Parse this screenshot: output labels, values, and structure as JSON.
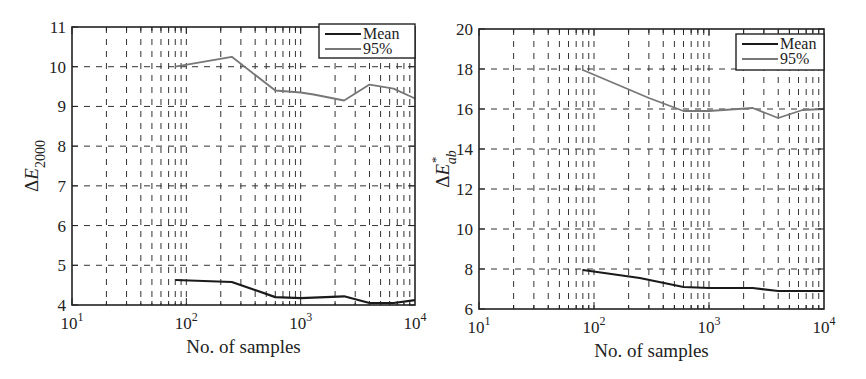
{
  "chart_data": [
    {
      "type": "line",
      "title": "",
      "xlabel": "No. of samples",
      "ylabel": "ΔE2000",
      "ylabel_main": "ΔE",
      "ylabel_sub": "2000",
      "ylabel_sup": "",
      "xscale": "log",
      "xlim": [
        10,
        10000
      ],
      "ylim": [
        4,
        11
      ],
      "yticks": [
        4,
        5,
        6,
        7,
        8,
        9,
        10,
        11
      ],
      "xticks": [
        {
          "base": "10",
          "exp": "1"
        },
        {
          "base": "10",
          "exp": "2"
        },
        {
          "base": "10",
          "exp": "3"
        },
        {
          "base": "10",
          "exp": "4"
        }
      ],
      "grid": true,
      "legend_position": "upper right",
      "series": [
        {
          "name": "Mean",
          "color": "#1a1a1a",
          "x": [
            80,
            250,
            600,
            1000,
            2400,
            4000,
            6500,
            10000
          ],
          "values": [
            4.63,
            4.58,
            4.2,
            4.17,
            4.22,
            4.05,
            4.05,
            4.12
          ]
        },
        {
          "name": "95%",
          "color": "#777777",
          "x": [
            80,
            250,
            600,
            1000,
            1300,
            2400,
            4000,
            6500,
            10000
          ],
          "values": [
            10.0,
            10.25,
            9.4,
            9.35,
            9.3,
            9.15,
            9.55,
            9.45,
            9.2
          ]
        }
      ]
    },
    {
      "type": "line",
      "title": "",
      "xlabel": "No. of samples",
      "ylabel": "ΔE*ab",
      "ylabel_main": "ΔE",
      "ylabel_sub": "ab",
      "ylabel_sup": "*",
      "xscale": "log",
      "xlim": [
        10,
        10000
      ],
      "ylim": [
        6,
        20
      ],
      "yticks": [
        6,
        8,
        10,
        12,
        14,
        16,
        18,
        20
      ],
      "xticks": [
        {
          "base": "10",
          "exp": "1"
        },
        {
          "base": "10",
          "exp": "2"
        },
        {
          "base": "10",
          "exp": "3"
        },
        {
          "base": "10",
          "exp": "4"
        }
      ],
      "grid": true,
      "legend_position": "upper right",
      "series": [
        {
          "name": "Mean",
          "color": "#1a1a1a",
          "x": [
            80,
            250,
            600,
            1000,
            2400,
            4000,
            6500,
            10000
          ],
          "values": [
            7.95,
            7.55,
            7.1,
            7.05,
            7.05,
            6.9,
            6.9,
            6.9
          ]
        },
        {
          "name": "95%",
          "color": "#777777",
          "x": [
            80,
            300,
            600,
            1000,
            2400,
            4000,
            6500,
            10000
          ],
          "values": [
            17.95,
            16.55,
            15.9,
            15.9,
            16.05,
            15.55,
            15.95,
            16.0
          ]
        }
      ]
    }
  ]
}
